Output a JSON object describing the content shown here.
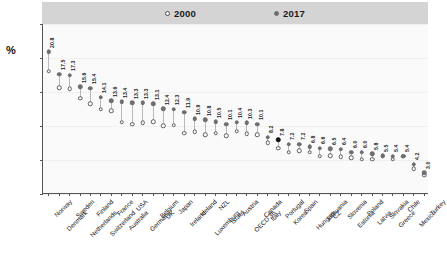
{
  "axis": {
    "ylabel": "%",
    "yticks": [
      "0",
      "5",
      "10",
      "15",
      "20",
      "25"
    ]
  },
  "legend": {
    "items": [
      {
        "label": "2000",
        "marker": "open-circle"
      },
      {
        "label": "2017",
        "marker": "filled-circle"
      }
    ]
  },
  "chart_data": {
    "type": "scatter",
    "title": "",
    "xlabel": "",
    "ylabel": "%",
    "ylim": [
      0,
      25
    ],
    "yticks": [
      0,
      5,
      10,
      15,
      20,
      25
    ],
    "grid": true,
    "legend_position": "top-center",
    "highlight": "Portugal",
    "categories": [
      "Norway",
      "Denmark",
      "Sweden",
      "Netherlands",
      "Finland",
      "Switzerland",
      "France",
      "Australia",
      "USA",
      "Germany",
      "Belgium",
      "UK",
      "Japan",
      "Ireland",
      "Iceland",
      "Luxemburg",
      "NZL",
      "Israel",
      "Austria",
      "OECD 36",
      "Canada",
      "Italy",
      "Portugal",
      "Korea",
      "Spain",
      "Hungary",
      "Lithuania",
      "CZ",
      "Slovenia",
      "Estonia",
      "Poland",
      "Latvia",
      "Slovakia",
      "Greece",
      "Chile",
      "Mexico",
      "Turkey"
    ],
    "series": [
      {
        "name": "2017",
        "marker": "filled-circle",
        "values": [
          20.8,
          17.5,
          17.3,
          15.6,
          15.4,
          14.1,
          13.6,
          13.4,
          13.3,
          13.3,
          13.1,
          12.4,
          12.3,
          11.9,
          10.9,
          10.8,
          10.5,
          10.1,
          10.4,
          10.3,
          10.1,
          8.2,
          7.8,
          7.2,
          7.2,
          6.8,
          6.6,
          6.5,
          6.4,
          6.0,
          6.0,
          5.8,
          5.5,
          5.4,
          5.4,
          4.2,
          3.0
        ]
      },
      {
        "name": "2000",
        "marker": "open-circle",
        "values": [
          17.9,
          15.5,
          15.3,
          13.9,
          13.1,
          12.3,
          12.1,
          10.4,
          10.1,
          10.3,
          10.5,
          9.9,
          10.0,
          8.8,
          9.0,
          8.6,
          8.8,
          8.4,
          9.1,
          8.7,
          8.6,
          7.4,
          6.6,
          6.0,
          6.2,
          6.0,
          5.4,
          5.5,
          5.3,
          5.2,
          5.0,
          5.0,
          5.4,
          5.0,
          5.4,
          3.6,
          2.6
        ]
      }
    ],
    "value_labels": [
      "20.8",
      "17.5",
      "17.3",
      "15.6",
      "15.4",
      "14.1",
      "13.6",
      "13.4",
      "13.3",
      "13.3",
      "13.1",
      "12.4",
      "12.3",
      "11.9",
      "10.9",
      "10.8",
      "10.5",
      "10.1",
      "10.4",
      "10.3",
      "10.1",
      "8.2",
      "7.8",
      "7.2",
      "7.2",
      "6.8",
      "6.6",
      "6.5",
      "6.4",
      "6.0",
      "6.0",
      "5.8",
      "5.5",
      "5.4",
      "5.4",
      "4.2",
      "3.0"
    ]
  }
}
